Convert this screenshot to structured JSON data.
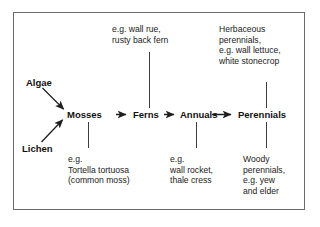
{
  "diagram": {
    "stroke_color": "#3d3d3d",
    "text_color": "#111111",
    "border_color": "#6a6a6a",
    "sources": [
      {
        "label": "Algae"
      },
      {
        "label": "Lichen"
      }
    ],
    "chain": [
      {
        "label": "Mosses"
      },
      {
        "label": "Ferns"
      },
      {
        "label": "Annuals"
      },
      {
        "label": "Perennials"
      }
    ],
    "notes_above": [
      {
        "for": "Ferns",
        "lines": [
          "e.g. wall rue,",
          "rusty back fern"
        ]
      },
      {
        "for": "Perennials",
        "lines": [
          "Herbaceous",
          "perennials,",
          "e.g. wall lettuce,",
          "white stonecrop"
        ]
      }
    ],
    "notes_below": [
      {
        "for": "Mosses",
        "lines": [
          "e.g.",
          "Tortella tortuosa",
          "(common moss)"
        ]
      },
      {
        "for": "Annuals",
        "lines": [
          "e.g.",
          "wall rocket,",
          "thale cress"
        ]
      },
      {
        "for": "Perennials",
        "lines": [
          "Woody",
          "perennials,",
          "e.g. yew",
          "and elder"
        ]
      }
    ]
  }
}
